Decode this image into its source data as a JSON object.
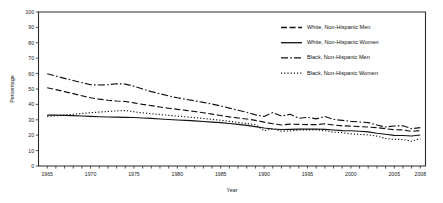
{
  "chart_data": {
    "type": "line",
    "title": "",
    "xlabel": "Year",
    "ylabel": "Percentage",
    "xlim": [
      1964,
      2008.6
    ],
    "ylim": [
      0,
      100
    ],
    "ytick_step": 10,
    "grid": false,
    "legend_position": "top-right",
    "x_tick_labels": [
      "1965",
      "1970",
      "1975",
      "1980",
      "1985",
      "1990",
      "1995",
      "2000",
      "2005",
      "2008"
    ],
    "x_tick_values": [
      1965,
      1970,
      1975,
      1980,
      1985,
      1990,
      1995,
      2000,
      2005,
      2008
    ],
    "x_minor_ticks_every": 1,
    "y_tick_labels": [
      "0",
      "10",
      "20",
      "30",
      "40",
      "50",
      "60",
      "70",
      "80",
      "90",
      "100"
    ],
    "y_tick_values": [
      0,
      10,
      20,
      30,
      40,
      50,
      60,
      70,
      80,
      90,
      100
    ],
    "x": [
      1965,
      1966,
      1967,
      1968,
      1969,
      1970,
      1971,
      1972,
      1973,
      1974,
      1975,
      1976,
      1977,
      1978,
      1979,
      1980,
      1981,
      1982,
      1983,
      1984,
      1985,
      1986,
      1987,
      1988,
      1989,
      1990,
      1991,
      1992,
      1993,
      1994,
      1995,
      1996,
      1997,
      1998,
      1999,
      2000,
      2001,
      2002,
      2003,
      2004,
      2005,
      2006,
      2007,
      2008
    ],
    "series": [
      {
        "name": "White, Non-Hispanic Men",
        "dash": "6,2.6",
        "values": [
          50.8,
          49.6,
          48.3,
          47.0,
          45.6,
          44.3,
          43.4,
          42.7,
          42.2,
          41.9,
          41.0,
          40.0,
          39.2,
          38.3,
          37.5,
          36.8,
          36.1,
          35.4,
          34.6,
          33.7,
          32.8,
          31.9,
          31.2,
          30.5,
          29.6,
          28.5,
          27.4,
          26.6,
          27.2,
          27.0,
          26.9,
          26.9,
          27.4,
          26.6,
          26.1,
          25.9,
          25.6,
          25.3,
          24.9,
          24.2,
          23.6,
          23.4,
          22.5,
          23.0
        ]
      },
      {
        "name": "White, Non-Hispanic Women",
        "dash": "none",
        "values": [
          33.0,
          33.0,
          32.9,
          32.7,
          32.5,
          32.2,
          32.0,
          31.8,
          31.7,
          31.6,
          31.5,
          31.2,
          30.9,
          30.5,
          30.2,
          29.9,
          29.6,
          29.3,
          28.9,
          28.5,
          28.2,
          27.6,
          27.0,
          26.4,
          25.6,
          24.7,
          24.0,
          23.7,
          23.8,
          23.9,
          23.9,
          24.0,
          23.8,
          23.4,
          23.0,
          22.9,
          22.6,
          22.2,
          21.3,
          20.6,
          19.9,
          19.8,
          19.5,
          20.1
        ]
      },
      {
        "name": "Black, Non-Hispanic Men",
        "dash": "7,2.2,1.6,2.2",
        "values": [
          59.9,
          58.4,
          56.9,
          55.5,
          54.1,
          52.8,
          52.6,
          52.8,
          53.4,
          53.2,
          51.8,
          50.0,
          48.3,
          46.9,
          45.5,
          44.3,
          43.3,
          42.3,
          41.3,
          40.2,
          39.0,
          37.6,
          36.2,
          34.9,
          33.2,
          32.2,
          34.7,
          32.4,
          33.6,
          31.0,
          31.6,
          30.6,
          32.1,
          30.3,
          29.6,
          29.0,
          28.6,
          28.2,
          26.6,
          25.3,
          26.0,
          26.1,
          24.3,
          24.9
        ]
      },
      {
        "name": "Black, Non-Hispanic Women",
        "dash": "1.2,2.0",
        "values": [
          32.2,
          32.6,
          33.1,
          33.6,
          34.1,
          34.6,
          35.0,
          35.4,
          35.8,
          36.0,
          35.2,
          34.5,
          34.0,
          33.4,
          32.9,
          32.4,
          31.9,
          31.4,
          30.9,
          30.3,
          29.7,
          29.0,
          28.3,
          27.6,
          26.8,
          22.9,
          24.3,
          22.6,
          22.8,
          23.3,
          23.5,
          23.4,
          22.9,
          22.0,
          21.6,
          20.9,
          20.5,
          20.2,
          19.4,
          17.9,
          17.3,
          17.2,
          16.1,
          17.8
        ]
      }
    ],
    "legend": [
      {
        "label": "White, Non-Hispanic Men",
        "dash": "6,2.6"
      },
      {
        "label": "White, Non-Hispanic Women",
        "dash": "none"
      },
      {
        "label": "Black, Non-Hispanic Men",
        "dash": "7,2.2,1.6,2.2"
      },
      {
        "label": "Black, Non-Hispanic Women",
        "dash": "1.2,2.0"
      }
    ]
  }
}
